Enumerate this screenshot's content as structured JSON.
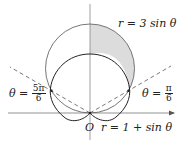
{
  "figure": {
    "labels": {
      "circle": "r = 3 sin θ",
      "cardioid": "r = 1 + sin θ",
      "origin": "O",
      "left_ray_prefix": "θ =",
      "left_ray_num": "5π",
      "left_ray_den": "6",
      "right_ray_prefix": "θ =",
      "right_ray_num": "π",
      "right_ray_den": "6"
    },
    "curves": [
      {
        "name": "circle",
        "equation": "r = 3 sin θ"
      },
      {
        "name": "cardioid",
        "equation": "r = 1 + sin θ"
      }
    ],
    "rays": [
      {
        "angle": "π/6"
      },
      {
        "angle": "5π/6"
      }
    ],
    "shaded_region": "inside r = 3 sin θ and outside r = 1 + sin θ, for π/6 ≤ θ ≤ 5π/6, right half shaded",
    "colors": {
      "curve": "#333333",
      "shade": "#d9d9d9",
      "axis": "#777777"
    }
  }
}
